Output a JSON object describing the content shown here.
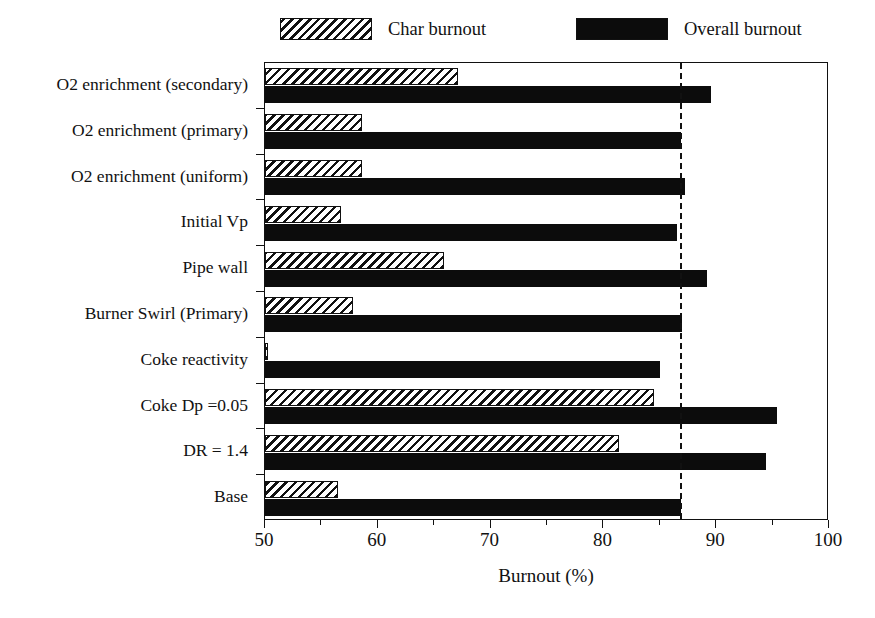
{
  "chart_data": {
    "type": "bar",
    "orientation": "horizontal",
    "title": "",
    "xlabel": "Burnout (%)",
    "ylabel": "",
    "xlim": [
      50,
      100
    ],
    "xticks": [
      50,
      60,
      70,
      80,
      90,
      100
    ],
    "xtick_labels": [
      "50",
      "60",
      "70",
      "80",
      "90",
      "100"
    ],
    "grid": false,
    "legend_position": "top",
    "categories": [
      "O2 enrichment (secondary)",
      "O2 enrichment (primary)",
      "O2 enrichment (uniform)",
      "Initial Vp",
      "Pipe wall",
      "Burner Swirl (Primary)",
      "Coke reactivity",
      "Coke  Dp =0.05",
      "DR = 1.4",
      "Base"
    ],
    "series": [
      {
        "name": "Char burnout",
        "fill": "hatched",
        "color": "#111111",
        "values": [
          67.1,
          58.6,
          58.6,
          56.7,
          65.9,
          57.8,
          50.3,
          84.5,
          81.4,
          56.5
        ]
      },
      {
        "name": "Overall burnout",
        "fill": "solid",
        "color": "#0c0c0c",
        "values": [
          89.5,
          86.9,
          87.2,
          86.5,
          89.2,
          87.0,
          85.0,
          95.4,
          94.4,
          86.9
        ]
      }
    ],
    "annotations": [
      {
        "type": "reference-line",
        "name": "base-overall-burnout-reference",
        "orientation": "vertical",
        "value": 86.8,
        "style": "dashed"
      }
    ]
  },
  "legend": {
    "items": [
      {
        "label": "Char burnout",
        "swatch": "hatched-swatch"
      },
      {
        "label": "Overall burnout",
        "swatch": "solid-swatch"
      }
    ]
  },
  "axis": {
    "x_title": "Burnout (%)",
    "x_tick_labels": [
      "50",
      "60",
      "70",
      "80",
      "90",
      "100"
    ]
  }
}
